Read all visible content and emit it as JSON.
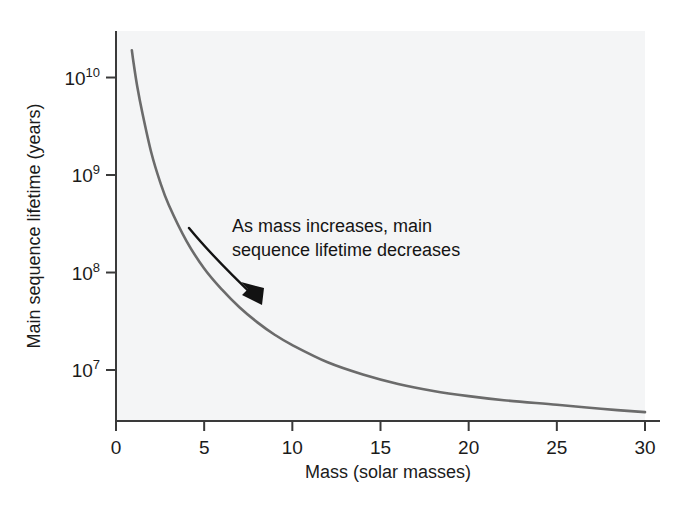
{
  "figure": {
    "background_color": "#ffffff",
    "plot_background_color": "#f4f5f6"
  },
  "annotation": {
    "line1": "As mass increases, main",
    "line2": "sequence lifetime decreases",
    "arrow_name": "curved-arrow"
  },
  "chart_data": {
    "type": "line",
    "title": "",
    "subtitle": "",
    "xlabel": "Mass (solar masses)",
    "ylabel": "Main sequence lifetime (years)",
    "xlim": [
      0,
      30
    ],
    "ylim": [
      3000000,
      30000000000
    ],
    "yscale": "log",
    "xscale": "linear",
    "grid": false,
    "legend": false,
    "legend_position": "none",
    "line_color": "#6b6b6b",
    "xticks": [
      0,
      5,
      10,
      15,
      20,
      25,
      30
    ],
    "xtick_labels": [
      "0",
      "5",
      "10",
      "15",
      "20",
      "25",
      "30"
    ],
    "yticks": [
      10000000,
      100000000,
      1000000000,
      10000000000
    ],
    "ytick_labels": [
      "10⁷",
      "10⁸",
      "10⁹",
      "10¹⁰"
    ],
    "ytick_bases": [
      "10",
      "10",
      "10",
      "10"
    ],
    "ytick_exponents": [
      "7",
      "8",
      "9",
      "10"
    ],
    "series": [
      {
        "name": "Main sequence lifetime",
        "x": [
          0.9,
          1.0,
          1.2,
          1.5,
          2.0,
          2.5,
          3.0,
          4.0,
          5.0,
          6.0,
          7.0,
          8.0,
          9.0,
          10.0,
          12.0,
          14.0,
          16.0,
          18.0,
          20.0,
          22.0,
          25.0,
          27.5,
          30.0
        ],
        "y": [
          19000000000,
          14000000000,
          8200000000,
          4300000000,
          1700000000,
          850000000,
          490000000,
          210000000,
          110000000,
          67000000,
          44000000,
          31000000,
          23000000,
          18000000,
          12000000,
          9000000,
          7200000,
          6100000,
          5400000,
          4900000,
          4400000,
          4000000,
          3700000
        ],
        "annotations": [
          {
            "text": "As mass increases, main sequence lifetime decreases",
            "x": 10,
            "y": 250000000
          }
        ]
      }
    ]
  },
  "axes": {
    "x_axis_name": "x-axis",
    "y_axis_name": "y-axis"
  }
}
